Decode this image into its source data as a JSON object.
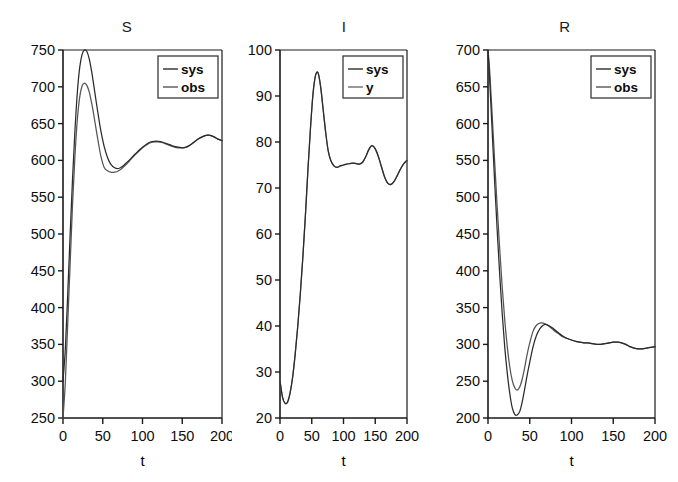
{
  "figure": {
    "width": 678,
    "height": 482,
    "background": "#ffffff",
    "axis_color": "#1a1a1a"
  },
  "panels": [
    {
      "id": "S",
      "title": "S",
      "xlabel": "t",
      "legend": [
        "sys",
        "obs"
      ]
    },
    {
      "id": "I",
      "title": "I",
      "xlabel": "t",
      "legend": [
        "sys",
        "y"
      ]
    },
    {
      "id": "R",
      "title": "R",
      "xlabel": "t",
      "legend": [
        "sys",
        "obs"
      ]
    }
  ],
  "chart_data": [
    {
      "type": "line",
      "title": "S",
      "xlabel": "t",
      "ylabel": "",
      "xlim": [
        0,
        200
      ],
      "ylim": [
        250,
        750
      ],
      "xticks": [
        0,
        50,
        100,
        150,
        200
      ],
      "yticks": [
        250,
        300,
        350,
        400,
        450,
        500,
        550,
        600,
        650,
        700,
        750
      ],
      "grid": false,
      "legend_position": "top-right",
      "series": [
        {
          "name": "sys",
          "color": "#2b2b2b",
          "x": [
            0,
            3,
            6,
            9,
            12,
            15,
            18,
            21,
            24,
            27,
            30,
            33,
            36,
            39,
            42,
            45,
            48,
            52,
            56,
            60,
            65,
            70,
            75,
            80,
            85,
            90,
            95,
            100,
            105,
            110,
            115,
            120,
            125,
            130,
            135,
            140,
            145,
            150,
            155,
            160,
            165,
            170,
            175,
            180,
            185,
            190,
            195,
            200
          ],
          "y": [
            300,
            345,
            420,
            500,
            575,
            640,
            692,
            726,
            744,
            750,
            748,
            738,
            721,
            700,
            678,
            657,
            638,
            618,
            604,
            595,
            590,
            589,
            592,
            597,
            602,
            608,
            613,
            618,
            622,
            625,
            626,
            626,
            625,
            623,
            621,
            619,
            618,
            617,
            618,
            621,
            625,
            629,
            632,
            634,
            634,
            632,
            629,
            627
          ]
        },
        {
          "name": "obs",
          "color": "#555555",
          "x": [
            0,
            3,
            6,
            9,
            12,
            15,
            18,
            21,
            24,
            27,
            30,
            33,
            36,
            39,
            42,
            45,
            48,
            52,
            56,
            60,
            65,
            70,
            75,
            80,
            85,
            90,
            95,
            100,
            105,
            110,
            115,
            120,
            125,
            130,
            135,
            140,
            145,
            150,
            155,
            160,
            165,
            170,
            175,
            180,
            185,
            190,
            195,
            200
          ],
          "y": [
            250,
            300,
            380,
            460,
            540,
            605,
            655,
            686,
            701,
            705,
            702,
            693,
            678,
            660,
            640,
            621,
            604,
            590,
            586,
            584,
            584,
            586,
            590,
            595,
            601,
            607,
            612,
            617,
            621,
            624,
            625,
            625,
            624,
            622,
            620,
            618,
            617,
            617,
            618,
            621,
            625,
            629,
            632,
            634,
            634,
            632,
            629,
            627
          ]
        }
      ]
    },
    {
      "type": "line",
      "title": "I",
      "xlabel": "t",
      "ylabel": "",
      "xlim": [
        0,
        200
      ],
      "ylim": [
        20,
        100
      ],
      "xticks": [
        0,
        50,
        100,
        150,
        200
      ],
      "yticks": [
        20,
        30,
        40,
        50,
        60,
        70,
        80,
        90,
        100
      ],
      "grid": false,
      "legend_position": "top-right",
      "series": [
        {
          "name": "sys",
          "color": "#2b2b2b",
          "x": [
            0,
            4,
            8,
            12,
            16,
            20,
            24,
            28,
            32,
            36,
            40,
            44,
            48,
            52,
            56,
            60,
            64,
            68,
            72,
            76,
            80,
            85,
            90,
            95,
            100,
            105,
            110,
            115,
            120,
            125,
            130,
            135,
            140,
            145,
            150,
            155,
            160,
            165,
            170,
            175,
            180,
            185,
            190,
            195,
            200
          ],
          "y": [
            28,
            24.5,
            23.2,
            23.5,
            25.5,
            29,
            34,
            40,
            47,
            55,
            64,
            74,
            83,
            90.5,
            94.5,
            95,
            92,
            87,
            82,
            78,
            76,
            74.8,
            74.5,
            74.8,
            75,
            75.2,
            75.3,
            75.4,
            75.3,
            75.2,
            75.6,
            76.8,
            78.4,
            79.2,
            78.5,
            76.8,
            74.5,
            72.3,
            71,
            70.8,
            71.5,
            72.8,
            74.2,
            75.3,
            76
          ]
        },
        {
          "name": "y",
          "color": "#6e6e6e",
          "x": [
            0,
            4,
            8,
            12,
            16,
            20,
            24,
            28,
            32,
            36,
            40,
            44,
            48,
            52,
            56,
            60,
            64,
            68,
            72,
            76,
            80,
            85,
            90,
            95,
            100,
            105,
            110,
            115,
            120,
            125,
            130,
            135,
            140,
            145,
            150,
            155,
            160,
            165,
            170,
            175,
            180,
            185,
            190,
            195,
            200
          ],
          "y": [
            28,
            24.5,
            23.2,
            23.5,
            25.5,
            29,
            34,
            40,
            47,
            55,
            64,
            74,
            83,
            90.5,
            94.5,
            95,
            92,
            87,
            82,
            78,
            76,
            74.8,
            74.5,
            74.8,
            75,
            75.2,
            75.3,
            75.4,
            75.3,
            75.2,
            75.6,
            76.8,
            78.4,
            79.2,
            78.5,
            76.8,
            74.5,
            72.3,
            71,
            70.8,
            71.5,
            72.8,
            74.2,
            75.3,
            76
          ]
        }
      ]
    },
    {
      "type": "line",
      "title": "R",
      "xlabel": "t",
      "ylabel": "",
      "xlim": [
        0,
        200
      ],
      "ylim": [
        200,
        700
      ],
      "xticks": [
        0,
        50,
        100,
        150,
        200
      ],
      "yticks": [
        200,
        250,
        300,
        350,
        400,
        450,
        500,
        550,
        600,
        650,
        700
      ],
      "grid": false,
      "legend_position": "top-right",
      "series": [
        {
          "name": "sys",
          "color": "#2b2b2b",
          "x": [
            0,
            2,
            5,
            8,
            11,
            14,
            17,
            20,
            23,
            26,
            29,
            32,
            35,
            38,
            41,
            44,
            47,
            50,
            54,
            58,
            62,
            66,
            70,
            75,
            80,
            85,
            90,
            95,
            100,
            105,
            110,
            115,
            120,
            125,
            130,
            135,
            140,
            145,
            150,
            155,
            160,
            165,
            170,
            175,
            180,
            185,
            190,
            195,
            200
          ],
          "y": [
            700,
            660,
            590,
            520,
            455,
            395,
            342,
            297,
            262,
            234,
            214,
            205,
            204,
            209,
            222,
            240,
            259,
            276,
            297,
            312,
            321,
            326,
            327,
            324,
            320,
            315,
            311,
            308,
            306,
            304,
            303,
            302,
            302,
            301,
            300,
            300,
            301,
            302,
            303,
            303,
            302,
            300,
            297,
            295,
            294,
            294,
            295,
            296,
            297
          ]
        },
        {
          "name": "obs",
          "color": "#555555",
          "x": [
            0,
            2,
            5,
            8,
            11,
            14,
            17,
            20,
            23,
            26,
            29,
            32,
            35,
            38,
            41,
            44,
            47,
            50,
            54,
            58,
            62,
            66,
            70,
            75,
            80,
            85,
            90,
            95,
            100,
            105,
            110,
            115,
            120,
            125,
            130,
            135,
            140,
            145,
            150,
            155,
            160,
            165,
            170,
            175,
            180,
            185,
            190,
            195,
            200
          ],
          "y": [
            700,
            672,
            612,
            548,
            487,
            430,
            378,
            334,
            298,
            270,
            251,
            241,
            238,
            242,
            253,
            269,
            287,
            302,
            318,
            326,
            329,
            329,
            327,
            323,
            318,
            314,
            310,
            308,
            306,
            304,
            303,
            302,
            302,
            301,
            300,
            300,
            301,
            302,
            303,
            303,
            302,
            300,
            297,
            295,
            294,
            294,
            295,
            296,
            297
          ]
        }
      ]
    }
  ]
}
